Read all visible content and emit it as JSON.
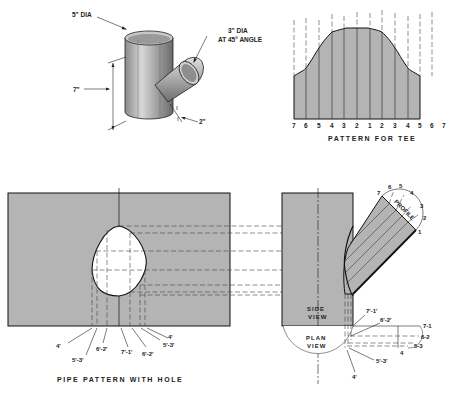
{
  "colors": {
    "sheet_fill": "#b4b4b4",
    "background": "#ffffff",
    "line": "#1a1a1a"
  },
  "isometric_tee": {
    "main_pipe_label": "5\" DIA",
    "branch_pipe_label_line1": "3\" DIA",
    "branch_pipe_label_line2": "AT 45° ANGLE",
    "height_label": "7\"",
    "offset_label": "2\""
  },
  "tee_pattern": {
    "caption": "PATTERN FOR TEE",
    "station_labels": [
      "7",
      "6",
      "5",
      "4",
      "3",
      "2",
      "1",
      "2",
      "3",
      "4",
      "5",
      "6",
      "7"
    ]
  },
  "pipe_pattern": {
    "caption": "PIPE PATTERN WITH HOLE",
    "callouts": [
      "4'",
      "5'-3'",
      "6'-2'",
      "7'-1'",
      "6'-2'",
      "5'-3'",
      "4'"
    ]
  },
  "views": {
    "side_view_line1": "SIDE",
    "side_view_line2": "VIEW",
    "plan_view_line1": "PLAN",
    "plan_view_line2": "VIEW",
    "profile_label": "PROFILE",
    "profile_numbers": [
      "7",
      "6",
      "5",
      "4",
      "3",
      "2",
      "1"
    ],
    "plan_callouts": {
      "c71p": "7'-1'",
      "c62p": "6'-2'",
      "c53p": "5'-3'",
      "c4p": "4'"
    },
    "plan_right_labels": [
      "7-1",
      "6-2",
      "5-3",
      "4"
    ]
  }
}
